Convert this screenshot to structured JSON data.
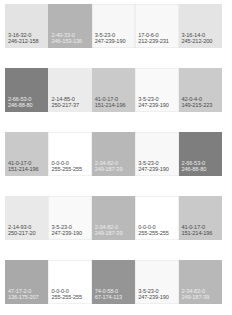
{
  "rows": [
    {
      "swatches": [
        {
          "cmyk": "3-16-32-0",
          "rgb": "246-212-158",
          "display": "#e3e3e3",
          "tone": "light"
        },
        {
          "cmyk": "2-40-33-0",
          "rgb": "246-153-136",
          "display": "#b4b4b4",
          "tone": "dark"
        },
        {
          "cmyk": "3-5-23-0",
          "rgb": "247-239-190",
          "display": "#f7f7f7",
          "tone": "light"
        },
        {
          "cmyk": "17-0-6-0",
          "rgb": "212-239-231",
          "display": "#f8f8f8",
          "tone": "light"
        },
        {
          "cmyk": "3-16-14-0",
          "rgb": "245-212-200",
          "display": "#e4e4e4",
          "tone": "light"
        }
      ]
    },
    {
      "swatches": [
        {
          "cmyk": "2-66-53-0",
          "rgb": "246-88-80",
          "display": "#7f7f7f",
          "tone": "dark"
        },
        {
          "cmyk": "2-14-85-0",
          "rgb": "250-217-37",
          "display": "#ebebeb",
          "tone": "light"
        },
        {
          "cmyk": "41-0-17-0",
          "rgb": "151-214-196",
          "display": "#cacaca",
          "tone": "light"
        },
        {
          "cmyk": "3-5-23-0",
          "rgb": "247-239-190",
          "display": "#f9f9f9",
          "tone": "light"
        },
        {
          "cmyk": "42-0-4-0",
          "rgb": "149-215-223",
          "display": "#cbcbcb",
          "tone": "light"
        }
      ]
    },
    {
      "swatches": [
        {
          "cmyk": "41-0-17-0",
          "rgb": "151-214-196",
          "display": "#c9c9c9",
          "tone": "light"
        },
        {
          "cmyk": "0-0-0-0",
          "rgb": "255-255-255",
          "display": "#ffffff",
          "tone": "light"
        },
        {
          "cmyk": "2-34-82-0",
          "rgb": "249-187-39",
          "display": "#b8b8b8",
          "tone": "dark"
        },
        {
          "cmyk": "3-5-23-0",
          "rgb": "247-239-190",
          "display": "#f8f8f8",
          "tone": "light"
        },
        {
          "cmyk": "2-66-53-0",
          "rgb": "246-88-80",
          "display": "#7e7e7e",
          "tone": "dark"
        }
      ]
    },
    {
      "swatches": [
        {
          "cmyk": "2-14-93-0",
          "rgb": "250-217-20",
          "display": "#e9e9e9",
          "tone": "light"
        },
        {
          "cmyk": "3-5-23-0",
          "rgb": "247-239-190",
          "display": "#f9f9f9",
          "tone": "light"
        },
        {
          "cmyk": "2-34-82-0",
          "rgb": "249-187-39",
          "display": "#b9b9b9",
          "tone": "dark"
        },
        {
          "cmyk": "0-0-0-0",
          "rgb": "255-255-255",
          "display": "#ffffff",
          "tone": "light"
        },
        {
          "cmyk": "41-0-17-0",
          "rgb": "151-214-196",
          "display": "#c9c9c9",
          "tone": "light"
        }
      ]
    },
    {
      "swatches": [
        {
          "cmyk": "47-17-2-0",
          "rgb": "136-175-207",
          "display": "#a9a9a9",
          "tone": "dark"
        },
        {
          "cmyk": "0-0-0-0",
          "rgb": "255-255-255",
          "display": "#ffffff",
          "tone": "light"
        },
        {
          "cmyk": "74-0-58-0",
          "rgb": "67-174-113",
          "display": "#959595",
          "tone": "dark"
        },
        {
          "cmyk": "3-5-23-0",
          "rgb": "247-239-190",
          "display": "#f8f8f8",
          "tone": "light"
        },
        {
          "cmyk": "2-34-82-0",
          "rgb": "249-187-39",
          "display": "#b8b8b8",
          "tone": "dark"
        }
      ]
    }
  ]
}
